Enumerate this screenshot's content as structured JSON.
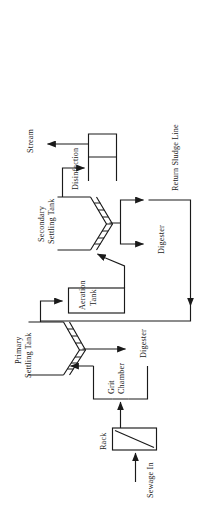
{
  "figure": {
    "type": "process-flow-diagram",
    "orientation_note": "Diagram is rendered rotated 90 degrees counter-clockwise within a 209x506 portrait frame",
    "background_color": "#ffffff",
    "line_color": "#1a1a1a"
  },
  "labels": {
    "sewage_in": "Sewage In",
    "rack": "Rack",
    "grit_chamber_line1": "Grit",
    "grit_chamber_line2": "Chamber",
    "primary_settling_line1": "Primary",
    "primary_settling_line2": "Settling Tank",
    "aeration_line1": "Aeration",
    "aeration_line2": "Tank",
    "secondary_settling_line1": "Secondary",
    "secondary_settling_line2": "Settling Tank",
    "disinfection": "Disinfection",
    "stream": "Stream",
    "digester_primary": "Digester",
    "digester_secondary": "Digester",
    "return_sludge_line": "Return Sludge Line"
  },
  "nodes": [
    {
      "id": "rack",
      "label": "Rack",
      "shape": "rectangle-with-diagonal-bar-screen"
    },
    {
      "id": "grit-chamber",
      "label": "Grit Chamber",
      "shape": "open-rectangle"
    },
    {
      "id": "primary-settling-tank",
      "label": "Primary Settling Tank",
      "shape": "hatched-v-basin"
    },
    {
      "id": "aeration-tank",
      "label": "Aeration Tank",
      "shape": "rectangle"
    },
    {
      "id": "secondary-settling-tank",
      "label": "Secondary Settling Tank",
      "shape": "hatched-v-basin"
    },
    {
      "id": "disinfection",
      "label": "Disinfection",
      "shape": "serpentine-contact-chamber"
    }
  ],
  "flows": [
    {
      "from": "sewage-in",
      "to": "rack",
      "label": "Sewage In"
    },
    {
      "from": "rack",
      "to": "grit-chamber",
      "label": ""
    },
    {
      "from": "grit-chamber",
      "to": "primary-settling-tank",
      "label": ""
    },
    {
      "from": "primary-settling-tank",
      "to": "digester-primary",
      "label": "Digester"
    },
    {
      "from": "primary-settling-tank",
      "to": "aeration-tank",
      "label": ""
    },
    {
      "from": "aeration-tank",
      "to": "secondary-settling-tank",
      "label": ""
    },
    {
      "from": "secondary-settling-tank",
      "to": "disinfection",
      "label": ""
    },
    {
      "from": "secondary-settling-tank",
      "to": "digester-secondary",
      "label": "Digester"
    },
    {
      "from": "secondary-settling-tank",
      "to": "aeration-tank",
      "label": "Return Sludge Line"
    },
    {
      "from": "disinfection",
      "to": "stream",
      "label": "Stream"
    }
  ]
}
